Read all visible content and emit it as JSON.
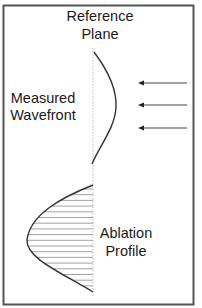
{
  "labels": {
    "reference_plane": [
      "Reference",
      "Plane"
    ],
    "measured_wavefront": [
      "Measured",
      "Wavefront"
    ],
    "ablation_profile": [
      "Ablation",
      "Profile"
    ]
  },
  "colors": {
    "border": "#555555",
    "curve": "#333333",
    "reference_line": "#bbbbbb",
    "hatch": "#999999",
    "arrow": "#444444",
    "text": "#1a1a1a"
  },
  "arrows": {
    "count": 3,
    "direction": "left",
    "y_positions": [
      83,
      105,
      128
    ]
  },
  "hatching": {
    "style": "horizontal-lines",
    "count": 18
  }
}
